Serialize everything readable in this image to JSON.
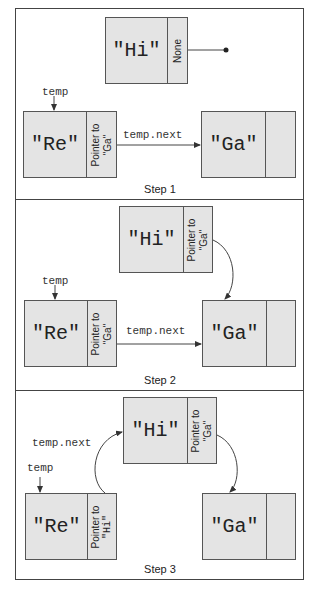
{
  "steps": [
    {
      "caption": "Step 1",
      "nodes": [
        {
          "value": "\"Hi\"",
          "pointer_line1": "None",
          "pointer_line2": ""
        },
        {
          "value": "\"Re\"",
          "pointer_line1": "Pointer to",
          "pointer_line2": "\"Ga\""
        },
        {
          "value": "\"Ga\"",
          "pointer_line1": "",
          "pointer_line2": ""
        }
      ],
      "labels": {
        "temp": "temp",
        "temp_next": "temp.next"
      }
    },
    {
      "caption": "Step 2",
      "nodes": [
        {
          "value": "\"Hi\"",
          "pointer_line1": "Pointer to",
          "pointer_line2": "\"Ga\""
        },
        {
          "value": "\"Re\"",
          "pointer_line1": "Pointer to",
          "pointer_line2": "\"Ga\""
        },
        {
          "value": "\"Ga\"",
          "pointer_line1": "",
          "pointer_line2": ""
        }
      ],
      "labels": {
        "temp": "temp",
        "temp_next": "temp.next"
      }
    },
    {
      "caption": "Step 3",
      "nodes": [
        {
          "value": "\"Hi\"",
          "pointer_line1": "Pointer to",
          "pointer_line2": "\"Ga\""
        },
        {
          "value": "\"Re\"",
          "pointer_line1": "Pointer to",
          "pointer_line2": "\"Hi\""
        },
        {
          "value": "\"Ga\"",
          "pointer_line1": "",
          "pointer_line2": ""
        }
      ],
      "labels": {
        "temp": "temp",
        "temp_next": "temp.next"
      }
    }
  ],
  "colors": {
    "node_fill": "#e4e4e4",
    "border": "#555555",
    "line": "#444444"
  }
}
